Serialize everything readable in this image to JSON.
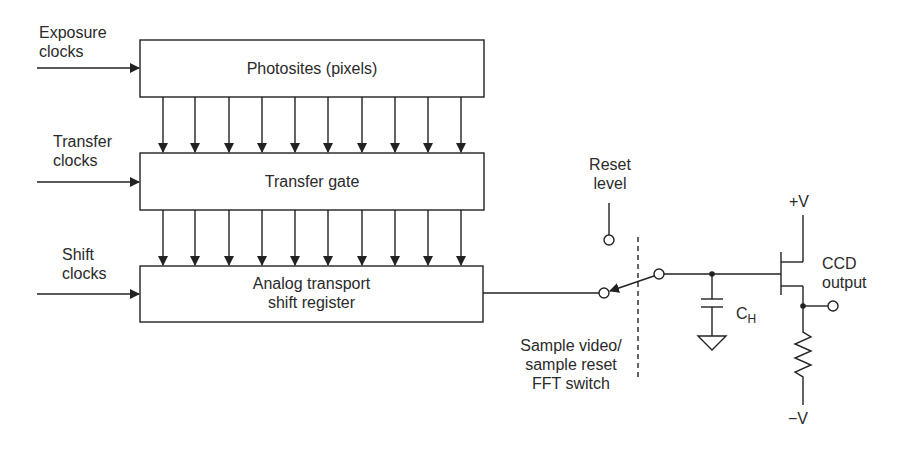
{
  "diagram": {
    "blocks": [
      {
        "id": "photosites",
        "label": "Photosites (pixels)"
      },
      {
        "id": "transfer_gate",
        "label": "Transfer gate"
      },
      {
        "id": "shift_register",
        "label_line1": "Analog transport",
        "label_line2": "shift register"
      }
    ],
    "inputs": [
      {
        "line1": "Exposure",
        "line2": "clocks",
        "target": "photosites"
      },
      {
        "line1": "Transfer",
        "line2": "clocks",
        "target": "transfer_gate"
      },
      {
        "line1": "Shift",
        "line2": "clocks",
        "target": "shift_register"
      }
    ],
    "parallel_arrows_per_stage": 10,
    "switch": {
      "reset_line1": "Reset",
      "reset_line2": "level",
      "caption_line1": "Sample video/",
      "caption_line2": "sample reset",
      "caption_line3": "FFT switch"
    },
    "capacitor": {
      "label": "C",
      "subscript": "H"
    },
    "supply_positive": "+V",
    "supply_negative": "−V",
    "output": {
      "line1": "CCD",
      "line2": "output"
    }
  }
}
